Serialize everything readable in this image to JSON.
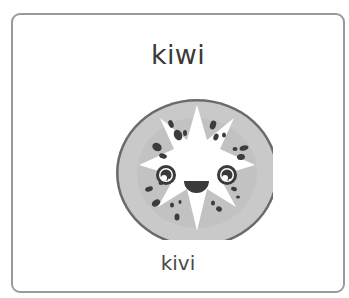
{
  "card": {
    "title": "kiwi",
    "subtitle": "kivi",
    "image": {
      "subject": "kiwi-slice-face-icon",
      "colors": {
        "rim": "#6a6a6a",
        "flesh": "#c9c9c9",
        "flesh_inner": "#bdbdbd",
        "core": "#ffffff",
        "seeds": "#3c3c3c",
        "face": "#3a3a3a"
      }
    }
  }
}
